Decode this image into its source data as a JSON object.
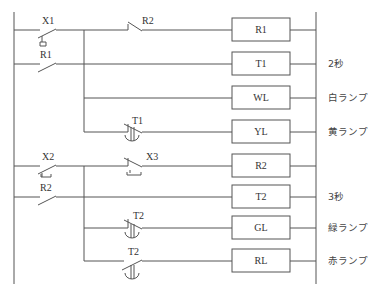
{
  "diagram": {
    "type": "ladder-logic",
    "rungs": [
      {
        "contacts": [
          "X1 (NO, push)",
          "R2 (NC)"
        ],
        "coil": "R1",
        "note": ""
      },
      {
        "contacts": [
          "R1 (NO, parallel to X1)"
        ],
        "coil": "T1",
        "note": "2秒"
      },
      {
        "contacts": [],
        "coil": "WL",
        "note": "白ランプ"
      },
      {
        "contacts": [
          "T1 (NC, timer)"
        ],
        "coil": "YL",
        "note": "黄ランプ"
      },
      {
        "contacts": [
          "X2 (NO, push)",
          "X3 (NC, push)"
        ],
        "coil": "R2",
        "note": ""
      },
      {
        "contacts": [
          "R2 (NO, parallel to X2)"
        ],
        "coil": "T2",
        "note": "3秒"
      },
      {
        "contacts": [
          "T2 (NC, timer)"
        ],
        "coil": "GL",
        "note": "緑ランプ"
      },
      {
        "contacts": [
          "T2 (NO, timer)"
        ],
        "coil": "RL",
        "note": "赤ランプ"
      }
    ]
  },
  "labels": {
    "x1": "X1",
    "r2_nc": "R2",
    "r1_no": "R1",
    "t1_nc": "T1",
    "x2": "X2",
    "x3": "X3",
    "r2_no": "R2",
    "t2_nc": "T2",
    "t2_no": "T2"
  },
  "coils": [
    "R1",
    "T1",
    "WL",
    "YL",
    "R2",
    "T2",
    "GL",
    "RL"
  ],
  "notes": {
    "t1": "2秒",
    "wl": "白ランプ",
    "yl": "黄ランプ",
    "t2": "3秒",
    "gl": "緑ランプ",
    "rl": "赤ランプ"
  }
}
